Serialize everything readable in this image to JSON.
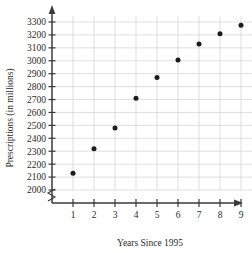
{
  "chart_data": {
    "type": "scatter",
    "title": "",
    "xlabel": "Years Since 1995",
    "ylabel": "Prescriptions (in millions)",
    "x": [
      1,
      2,
      3,
      4,
      5,
      6,
      7,
      8,
      9
    ],
    "values": [
      2130,
      2320,
      2480,
      2710,
      2870,
      3005,
      3130,
      3210,
      3275
    ],
    "xticks": [
      "1",
      "2",
      "3",
      "4",
      "5",
      "6",
      "7",
      "8",
      "9"
    ],
    "yticks": [
      "2000",
      "2100",
      "2200",
      "2300",
      "2400",
      "2500",
      "2600",
      "2700",
      "2800",
      "2900",
      "3000",
      "3100",
      "3200",
      "3300"
    ],
    "ytick_values": [
      2000,
      2100,
      2200,
      2300,
      2400,
      2500,
      2600,
      2700,
      2800,
      2900,
      3000,
      3100,
      3200,
      3300
    ],
    "xlim": [
      0,
      10
    ],
    "ylim": [
      2000,
      3350
    ],
    "grid": true,
    "legend": "none",
    "axis_break": true,
    "marker": "filled-circle",
    "marker_color": "#1c1c1c",
    "grid_color": "#c9c9c9",
    "axis_color": "#3a3a3a"
  }
}
